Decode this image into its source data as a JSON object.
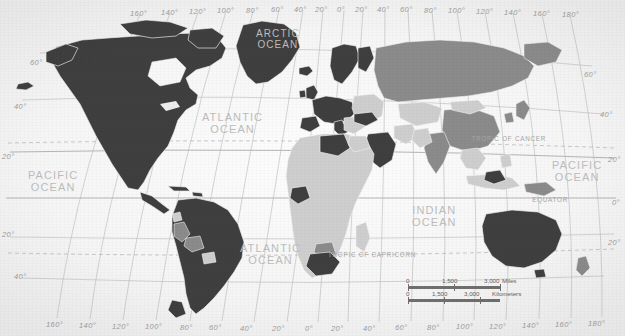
{
  "map": {
    "title": "World Map",
    "projection": "Robinson-style world projection",
    "ocean_labels": [
      {
        "name": "ARCTIC OCEAN",
        "line1": "ARCTIC",
        "line2": "OCEAN",
        "x": 256,
        "y": 29,
        "size": "sm"
      },
      {
        "name": "ATLANTIC OCEAN",
        "line1": "ATLANTIC",
        "line2": "OCEAN",
        "x": 202,
        "y": 112,
        "size": "md"
      },
      {
        "name": "ATLANTIC OCEAN",
        "line1": "ATLANTIC",
        "line2": "OCEAN",
        "x": 240,
        "y": 243,
        "size": "md"
      },
      {
        "name": "PACIFIC OCEAN",
        "line1": "PACIFIC",
        "line2": "OCEAN",
        "x": 28,
        "y": 170,
        "size": "md"
      },
      {
        "name": "PACIFIC OCEAN",
        "line1": "PACIFIC",
        "line2": "OCEAN",
        "x": 552,
        "y": 160,
        "size": "md"
      },
      {
        "name": "INDIAN OCEAN",
        "line1": "INDIAN",
        "line2": "OCEAN",
        "x": 412,
        "y": 205,
        "size": "md"
      }
    ],
    "reference_lines": [
      {
        "label": "TROPIC OF CANCER",
        "x": 546,
        "y": 135
      },
      {
        "label": "TROPIC OF CAPRICORN",
        "x": 416,
        "y": 251
      },
      {
        "label": "EQUATOR",
        "x": 568,
        "y": 196
      }
    ],
    "longitude_labels_top": [
      {
        "text": "160°",
        "x": 130,
        "y": 9
      },
      {
        "text": "140°",
        "x": 161,
        "y": 8
      },
      {
        "text": "120°",
        "x": 189,
        "y": 7
      },
      {
        "text": "100°",
        "x": 217,
        "y": 6
      },
      {
        "text": "80°",
        "x": 246,
        "y": 6
      },
      {
        "text": "60°",
        "x": 271,
        "y": 5
      },
      {
        "text": "40°",
        "x": 294,
        "y": 5
      },
      {
        "text": "20°",
        "x": 315,
        "y": 5
      },
      {
        "text": "0°",
        "x": 337,
        "y": 5
      },
      {
        "text": "20°",
        "x": 355,
        "y": 5
      },
      {
        "text": "40°",
        "x": 377,
        "y": 5
      },
      {
        "text": "60°",
        "x": 400,
        "y": 5
      },
      {
        "text": "80°",
        "x": 424,
        "y": 6
      },
      {
        "text": "100°",
        "x": 448,
        "y": 6
      },
      {
        "text": "120°",
        "x": 476,
        "y": 7
      },
      {
        "text": "140°",
        "x": 504,
        "y": 8
      },
      {
        "text": "160°",
        "x": 533,
        "y": 9
      },
      {
        "text": "180°",
        "x": 562,
        "y": 10
      }
    ],
    "longitude_labels_bottom": [
      {
        "text": "160°",
        "x": 46,
        "y": 320
      },
      {
        "text": "140°",
        "x": 79,
        "y": 321
      },
      {
        "text": "120°",
        "x": 112,
        "y": 322
      },
      {
        "text": "100°",
        "x": 145,
        "y": 322
      },
      {
        "text": "80°",
        "x": 180,
        "y": 323
      },
      {
        "text": "60°",
        "x": 209,
        "y": 323
      },
      {
        "text": "40°",
        "x": 240,
        "y": 324
      },
      {
        "text": "20°",
        "x": 272,
        "y": 324
      },
      {
        "text": "0°",
        "x": 305,
        "y": 324
      },
      {
        "text": "20°",
        "x": 331,
        "y": 324
      },
      {
        "text": "40°",
        "x": 363,
        "y": 324
      },
      {
        "text": "60°",
        "x": 395,
        "y": 323
      },
      {
        "text": "80°",
        "x": 427,
        "y": 323
      },
      {
        "text": "100°",
        "x": 456,
        "y": 322
      },
      {
        "text": "120°",
        "x": 489,
        "y": 322
      },
      {
        "text": "140°",
        "x": 522,
        "y": 321
      },
      {
        "text": "160°",
        "x": 555,
        "y": 320
      },
      {
        "text": "180°",
        "x": 588,
        "y": 319
      }
    ],
    "latitude_labels_left": [
      {
        "text": "60°",
        "x": 30,
        "y": 58
      },
      {
        "text": "40°",
        "x": 14,
        "y": 102
      },
      {
        "text": "20°",
        "x": 2,
        "y": 152
      },
      {
        "text": "20°",
        "x": 2,
        "y": 230
      },
      {
        "text": "40°",
        "x": 14,
        "y": 272
      }
    ],
    "latitude_labels_right": [
      {
        "text": "60°",
        "x": 584,
        "y": 70
      },
      {
        "text": "40°",
        "x": 600,
        "y": 110
      },
      {
        "text": "20°",
        "x": 608,
        "y": 155
      },
      {
        "text": "0°",
        "x": 612,
        "y": 198
      },
      {
        "text": "20°",
        "x": 608,
        "y": 238
      }
    ],
    "scale_bar": {
      "miles": {
        "ticks": [
          "0",
          "1,500",
          "3,000"
        ],
        "unit": "Miles"
      },
      "kilometers": {
        "ticks": [
          "0",
          "1,500",
          "3,000"
        ],
        "unit": "Kilometers"
      }
    },
    "colors": {
      "ocean": "#f7f7f7",
      "land_dark": "#3f3f3f",
      "land_mid": "#8b8b8b",
      "land_light": "#cecece",
      "land_pale": "#e2e2e2",
      "graticule": "#b9b9b9",
      "label_text": "#a9a9a9"
    }
  }
}
